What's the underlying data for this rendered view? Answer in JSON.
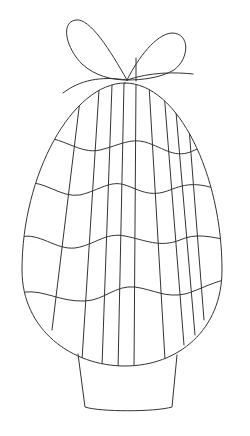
{
  "image": {
    "subject": "Easter egg coloring page",
    "background": "#ffffff",
    "stroke_color": "#333333",
    "elements": [
      "bow",
      "egg",
      "vertical-stripes",
      "wavy-bands",
      "stand"
    ]
  }
}
